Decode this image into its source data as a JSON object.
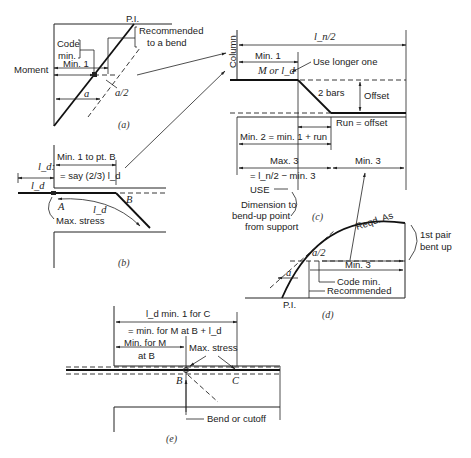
{
  "figure": {
    "panels": [
      {
        "id": "a",
        "caption": "(a)",
        "labels": {
          "pi": "P.I.",
          "recommended": "Recommended",
          "to_a_bend": "to a bend",
          "code": "Code",
          "min": "min.",
          "min1": "Min. 1",
          "moment": "Moment",
          "a": "a",
          "a_half": "a/2"
        }
      },
      {
        "id": "b",
        "caption": "(b)",
        "labels": {
          "ld_top": "l_d:",
          "ld_left": "l_d",
          "min1_to_B": "Min. 1 to pt. B",
          "say": "= say (2/3) l_d",
          "B": "B",
          "A": "A",
          "ld_curve": "l_d",
          "max_stress": "Max. stress"
        }
      },
      {
        "id": "c",
        "caption": "(c)",
        "labels": {
          "column": "Column",
          "ln_half": "l_n/2",
          "min1": "Min. 1",
          "m_or_ld": "M or l_d",
          "use_longer": "Use longer one",
          "two_bars": "2 bars",
          "offset": "Offset",
          "run_offset": "Run = offset",
          "min2": "Min. 2 = min. 1 + run",
          "max3": "Max. 3",
          "max3_eq": "= l_n/2 − min. 3",
          "min3": "Min. 3",
          "use": "USE",
          "dim_line1": "Dimension to",
          "dim_line2": "bend-up point",
          "dim_line3": "from support"
        }
      },
      {
        "id": "d",
        "caption": "(d)",
        "labels": {
          "reqd_as": "Reqd. As",
          "first_pair": "1st pair",
          "bent_up": "bent up",
          "a_half": "a/2",
          "min3": "Min. 3",
          "a": "a",
          "code_min": "Code min.",
          "recommended": "Recommended",
          "pi": "P.I."
        }
      },
      {
        "id": "e",
        "caption": "(e)",
        "labels": {
          "ld_min1_C": "l_d min. 1 for C",
          "min_for_M_eq": "= min. for M at B + l_d",
          "min_for_M": "Min. for M",
          "at_B": "at B",
          "max_stress": "Max. stress",
          "B": "B",
          "C": "C",
          "bend_or_cutoff": "Bend or cutoff"
        }
      }
    ],
    "colors": {
      "ink": "#222222",
      "background": "#ffffff"
    }
  }
}
